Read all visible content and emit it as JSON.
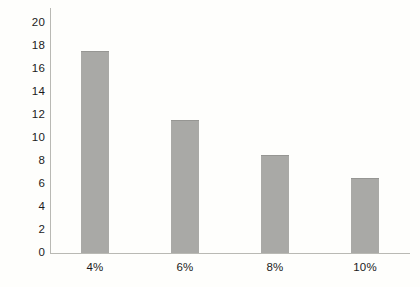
{
  "chart_data": {
    "type": "bar",
    "title": "",
    "subtitle": "",
    "xlabel": "",
    "ylabel": "",
    "categories": [
      "4%",
      "6%",
      "8%",
      "10%"
    ],
    "values": [
      17.6,
      11.6,
      8.5,
      6.5
    ],
    "series": [
      {
        "name": "",
        "values": [
          17.6,
          11.6,
          8.5,
          6.5
        ]
      }
    ],
    "ylim": [
      0,
      20
    ],
    "xlim": [
      0,
      4
    ],
    "y_ticks": [
      0,
      2,
      4,
      6,
      8,
      10,
      12,
      14,
      16,
      18,
      20
    ],
    "y_tick_labels": [
      "0",
      "2",
      "4",
      "6",
      "8",
      "10",
      "12",
      "14",
      "16",
      "18",
      "20"
    ],
    "x_tick_labels": [
      "4%",
      "6%",
      "8%",
      "10%"
    ],
    "grid": false,
    "legend": false,
    "legend_position": "none",
    "annotations": [],
    "colors": {
      "bar_fill": "#a9a9a6",
      "bar_edge": "#969693",
      "axis_line": "#b9b9b4",
      "tick_label": "#1b1b1b",
      "background": "#fefefc"
    }
  }
}
